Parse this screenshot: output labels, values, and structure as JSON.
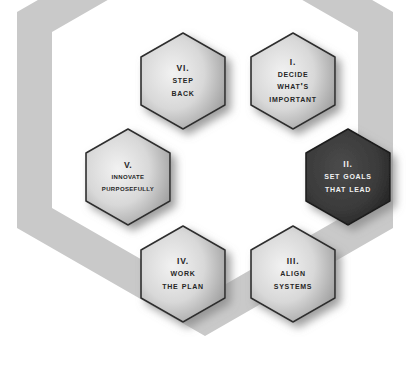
{
  "diagram": {
    "background_shape": "large-hexagon-outline",
    "colors": {
      "page_background": "#ffffff",
      "background_band": "#c9c9c9",
      "tile_light_center": "#f2f2f2",
      "tile_light_edge": "#9a9a9a",
      "tile_outline": "#2e2e2e",
      "tile_dark_fill": "#3a3a3a",
      "tile_dark_edge": "#1d1d1d",
      "text_dark": "#262626",
      "text_light": "#f2f2f2",
      "shadow": "#8d8d8d"
    },
    "hexagons": [
      {
        "id": "hex-1",
        "numeral": "I.",
        "lines": [
          "Decide",
          "What's",
          "Important"
        ],
        "state": "normal",
        "x": 251,
        "y": 33
      },
      {
        "id": "hex-2",
        "numeral": "II.",
        "lines": [
          "Set Goals",
          "That Lead"
        ],
        "state": "selected",
        "x": 306,
        "y": 129
      },
      {
        "id": "hex-3",
        "numeral": "III.",
        "lines": [
          "Align",
          "Systems"
        ],
        "state": "normal",
        "x": 251,
        "y": 226
      },
      {
        "id": "hex-4",
        "numeral": "IV.",
        "lines": [
          "Work",
          "the Plan"
        ],
        "state": "normal",
        "x": 141,
        "y": 226
      },
      {
        "id": "hex-5",
        "numeral": "V.",
        "lines": [
          "Innovate",
          "Purposefully"
        ],
        "state": "normal",
        "x": 86,
        "y": 129
      },
      {
        "id": "hex-6",
        "numeral": "VI.",
        "lines": [
          "Step",
          "back"
        ],
        "state": "normal",
        "x": 141,
        "y": 33
      }
    ]
  }
}
